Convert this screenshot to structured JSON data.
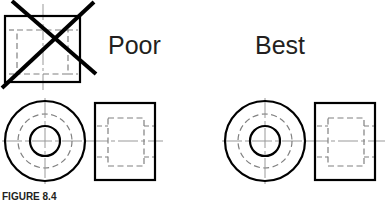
{
  "figure": {
    "caption": "FIGURE 8.4",
    "labels": {
      "poor": "Poor",
      "best": "Best"
    },
    "colors": {
      "object_line": "#000000",
      "hidden_line": "#808080",
      "center_line": "#999999",
      "cross_out": "#000000",
      "text": "#231f20",
      "background": "#ffffff"
    },
    "views": {
      "poor_front_square": {
        "name": "Poor front view (square with hidden rectangle)",
        "crossed_out": true,
        "x": 5,
        "y": 16,
        "width": 75,
        "height": 66
      },
      "poor_circular": {
        "name": "Poor circular view",
        "center_x": 45,
        "center_y": 141,
        "outer_radius": 40,
        "hidden_radius": 27,
        "inner_radius": 15
      },
      "poor_side_rect": {
        "name": "Poor side view rectangle",
        "x": 95,
        "y": 103,
        "width": 60,
        "height": 77
      },
      "best_circular": {
        "name": "Best circular view",
        "center_x": 265,
        "center_y": 141,
        "outer_radius": 40,
        "hidden_radius": 27,
        "inner_radius": 15
      },
      "best_side_rect": {
        "name": "Best side view rectangle",
        "x": 315,
        "y": 103,
        "width": 60,
        "height": 77
      }
    },
    "cross_out_mark": {
      "name": "X mark over poor front view",
      "stroke_width": 4,
      "line1": {
        "x1": 2,
        "y1": 88,
        "x2": 94,
        "y2": 2
      },
      "line2": {
        "x1": 12,
        "y1": 1,
        "x2": 96,
        "y2": 74
      }
    },
    "line_weights": {
      "object": 2.2,
      "hidden": 1.2,
      "center": 1.0
    }
  }
}
